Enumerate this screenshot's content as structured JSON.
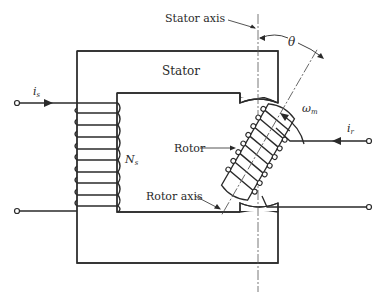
{
  "diagram": {
    "labels": {
      "stator_axis": "Stator axis",
      "theta": "θ",
      "stator": "Stator",
      "omega": "ω",
      "omega_sub": "m",
      "is": "i",
      "is_sub": "s",
      "ir": "i",
      "ir_sub": "r",
      "ns": "N",
      "ns_sub": "s",
      "rotor": "Rotor",
      "rotor_axis": "Rotor axis"
    },
    "colors": {
      "line": "#2a2a2a",
      "background": "#ffffff"
    },
    "rotor_angle_deg": 30
  }
}
